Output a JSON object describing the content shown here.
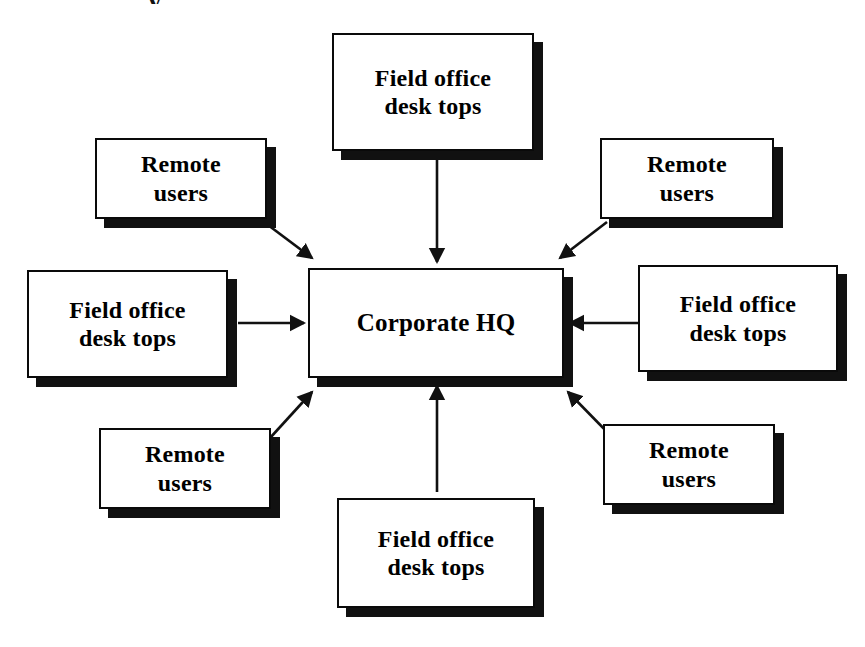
{
  "diagram": {
    "background_color": "#ffffff",
    "box_fill": "#ffffff",
    "box_border_color": "#0a0a0a",
    "box_shadow_color": "#111111",
    "arrow_color": "#111111",
    "text_color": "#000000",
    "top_cropped_fragment": "y",
    "hub": {
      "id": "corporate-hq",
      "label": "Corporate HQ",
      "x": 308,
      "y": 268,
      "width": 256,
      "height": 110
    },
    "nodes": [
      {
        "id": "field-office-desk-tops-top",
        "label": "Field office\ndesk tops",
        "position": "top-center",
        "x": 332,
        "y": 33,
        "width": 202,
        "height": 118
      },
      {
        "id": "remote-users-top-left",
        "label": "Remote\nusers",
        "position": "top-left",
        "x": 95,
        "y": 138,
        "width": 172,
        "height": 81
      },
      {
        "id": "remote-users-top-right",
        "label": "Remote\nusers",
        "position": "top-right",
        "x": 600,
        "y": 138,
        "width": 174,
        "height": 81
      },
      {
        "id": "field-office-desk-tops-left",
        "label": "Field office\ndesk tops",
        "position": "middle-left",
        "x": 27,
        "y": 270,
        "width": 201,
        "height": 108
      },
      {
        "id": "field-office-desk-tops-right",
        "label": "Field office\ndesk tops",
        "position": "middle-right",
        "x": 638,
        "y": 265,
        "width": 200,
        "height": 107
      },
      {
        "id": "remote-users-bottom-left",
        "label": "Remote\nusers",
        "position": "bottom-left",
        "x": 99,
        "y": 428,
        "width": 172,
        "height": 81
      },
      {
        "id": "remote-users-bottom-right",
        "label": "Remote\nusers",
        "position": "bottom-right",
        "x": 603,
        "y": 424,
        "width": 172,
        "height": 81
      },
      {
        "id": "field-office-desk-tops-bottom",
        "label": "Field office\ndesk tops",
        "position": "bottom-center",
        "x": 337,
        "y": 498,
        "width": 198,
        "height": 110
      }
    ],
    "arrows": [
      {
        "id": "arrow-top-center-to-hub",
        "from": "field-office-desk-tops-top",
        "to": "corporate-hq",
        "direction": "down",
        "x1": 437,
        "y1": 158,
        "x2": 437,
        "y2": 262
      },
      {
        "id": "arrow-top-left-to-hub",
        "from": "remote-users-top-left",
        "to": "corporate-hq",
        "direction": "down-right",
        "x1": 264,
        "y1": 222,
        "x2": 312,
        "y2": 258
      },
      {
        "id": "arrow-top-right-to-hub",
        "from": "remote-users-top-right",
        "to": "corporate-hq",
        "direction": "down-left",
        "x1": 607,
        "y1": 222,
        "x2": 560,
        "y2": 258
      },
      {
        "id": "arrow-left-to-hub",
        "from": "field-office-desk-tops-left",
        "to": "corporate-hq",
        "direction": "right",
        "x1": 238,
        "y1": 323,
        "x2": 304,
        "y2": 323
      },
      {
        "id": "arrow-right-to-hub",
        "from": "field-office-desk-tops-right",
        "to": "corporate-hq",
        "direction": "left",
        "x1": 640,
        "y1": 323,
        "x2": 570,
        "y2": 323
      },
      {
        "id": "arrow-bottom-left-to-hub",
        "from": "remote-users-bottom-left",
        "to": "corporate-hq",
        "direction": "up-right",
        "x1": 270,
        "y1": 438,
        "x2": 312,
        "y2": 392
      },
      {
        "id": "arrow-bottom-right-to-hub",
        "from": "remote-users-bottom-right",
        "to": "corporate-hq",
        "direction": "up-left",
        "x1": 613,
        "y1": 438,
        "x2": 568,
        "y2": 392
      },
      {
        "id": "arrow-bottom-center-to-hub",
        "from": "field-office-desk-tops-bottom",
        "to": "corporate-hq",
        "direction": "up",
        "x1": 437,
        "y1": 492,
        "x2": 437,
        "y2": 386
      }
    ]
  }
}
